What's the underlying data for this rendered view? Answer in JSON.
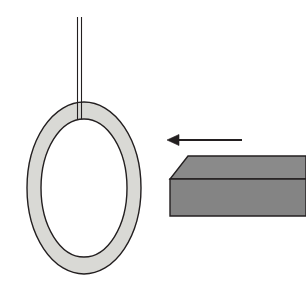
{
  "figure": {
    "background_color": "#ffffff",
    "width": 306,
    "height": 288
  },
  "colors": {
    "ring_fill": "#d9d9d5",
    "ring_stroke": "#231f20",
    "bar_top_fill": "#8a8a8a",
    "bar_front_fill": "#848484",
    "bar_stroke": "#231f20",
    "string_stroke": "#231f20",
    "arrow_color": "#231f20"
  },
  "objects": {
    "string": {
      "label": "suspension string",
      "x_left": 77.5,
      "x_right": 81.5,
      "y_top": 17,
      "y_bottom": 123,
      "stroke_width": 1.1
    },
    "ring": {
      "label": "ring",
      "center_x": 84,
      "center_y": 188,
      "outer_rx": 57,
      "outer_ry": 86,
      "inner_rx": 43,
      "inner_ry": 69,
      "stroke_width": 1.4,
      "fill": "#d9d9d5"
    },
    "bar": {
      "label": "bar",
      "top_face_points": "188,156 306,156 306,179 170,179",
      "front_face_points": "170,179 306,179 306,216 170,216",
      "left_slant_start_x": 170,
      "left_slant_top_x": 188,
      "top_y": 156,
      "mid_y": 179,
      "bottom_y": 216,
      "right_x": 306,
      "stroke_width": 1.4
    },
    "arrow": {
      "label": "velocity arrow",
      "direction": "left",
      "tail_x": 242,
      "tip_x": 167,
      "y": 140,
      "shaft_width": 2.2,
      "head_length": 12,
      "head_half_height": 5.5
    }
  }
}
